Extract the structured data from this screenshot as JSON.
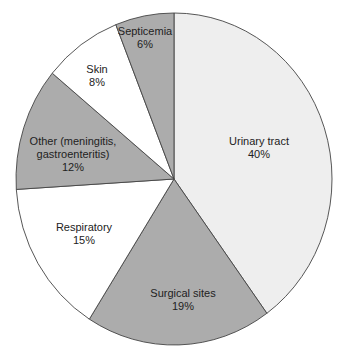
{
  "chart_data": {
    "type": "pie",
    "title": "",
    "start_angle_deg_from_top": 0,
    "direction": "clockwise",
    "slices": [
      {
        "label": "Urinary tract",
        "value": 40,
        "pct_label": "40%",
        "color": "#eeeeee",
        "label_pos": [
          259,
          148
        ]
      },
      {
        "label": "Surgical sites",
        "value": 19,
        "pct_label": "19%",
        "color": "#acacac",
        "label_pos": [
          183,
          300
        ]
      },
      {
        "label": "Respiratory",
        "value": 15,
        "pct_label": "15%",
        "color": "#ffffff",
        "label_pos": [
          84,
          234
        ]
      },
      {
        "label": "Other (meningitis, gastroenteritis)",
        "value": 12,
        "pct_label": "12%",
        "color": "#acacac",
        "label_pos": [
          73,
          154
        ]
      },
      {
        "label": "Skin",
        "value": 8,
        "pct_label": "8%",
        "color": "#ffffff",
        "label_pos": [
          97,
          76
        ]
      },
      {
        "label": "Septicemia",
        "value": 6,
        "pct_label": "6%",
        "color": "#acacac",
        "label_pos": [
          145,
          38
        ]
      }
    ],
    "center": [
      174,
      179
    ],
    "radius_x": 158,
    "radius_y": 166
  },
  "labels": {
    "urinary": {
      "name": "Urinary tract",
      "pct": "40%"
    },
    "surgical": {
      "name": "Surgical sites",
      "pct": "19%"
    },
    "respiratory": {
      "name": "Respiratory",
      "pct": "15%"
    },
    "other": {
      "line1": "Other (meningitis,",
      "line2": "gastroenteritis)",
      "pct": "12%"
    },
    "skin": {
      "name": "Skin",
      "pct": "8%"
    },
    "septicemia": {
      "name": "Septicemia",
      "pct": "6%"
    }
  }
}
